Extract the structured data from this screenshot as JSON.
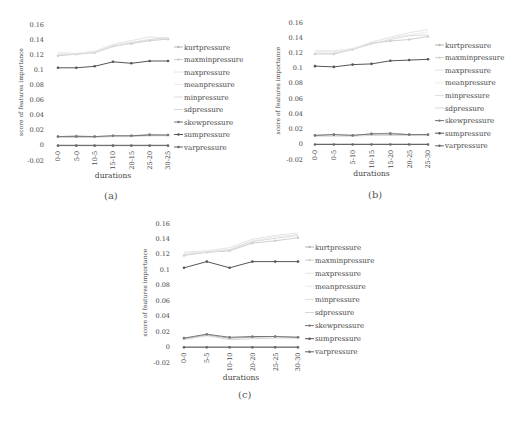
{
  "chart_data": [
    {
      "id": "a",
      "type": "line",
      "caption": "(a)",
      "title": "",
      "xlabel": "durations",
      "ylabel": "score of features importance",
      "ylim": [
        -0.02,
        0.16
      ],
      "yticks": [
        "0.16",
        "0.14",
        "0.12",
        "0.1",
        "0.08",
        "0.06",
        "0.04",
        "0.02",
        "0",
        "-0.02"
      ],
      "categories": [
        "0-0",
        "5-0",
        "10-5",
        "15-10",
        "20-15",
        "25-20",
        "30-25"
      ],
      "grid": false,
      "legend_position": "right",
      "series": [
        {
          "name": "kurtpressure",
          "color": "#b8b8b8",
          "marker": true,
          "values": [
            0.011,
            0.012,
            0.011,
            0.012,
            0.012,
            0.014,
            0.013
          ]
        },
        {
          "name": "maxminpressure",
          "color": "#cfcfcf",
          "marker": true,
          "values": [
            0.118,
            0.12,
            0.122,
            0.131,
            0.134,
            0.138,
            0.14
          ]
        },
        {
          "name": "maxpressure",
          "color": "#e4e4e4",
          "marker": false,
          "values": [
            0.122,
            0.121,
            0.124,
            0.133,
            0.138,
            0.143,
            0.141
          ]
        },
        {
          "name": "meanpressure",
          "color": "#ececec",
          "marker": false,
          "values": [
            0.12,
            0.121,
            0.123,
            0.132,
            0.136,
            0.14,
            0.141
          ]
        },
        {
          "name": "minpressure",
          "color": "#dcdcdc",
          "marker": false,
          "values": [
            0.119,
            0.12,
            0.122,
            0.13,
            0.135,
            0.139,
            0.142
          ]
        },
        {
          "name": "sdpressure",
          "color": "#d6d6d6",
          "marker": false,
          "values": [
            0.01,
            0.01,
            0.01,
            0.011,
            0.011,
            0.012,
            0.012
          ]
        },
        {
          "name": "skewpressure",
          "color": "#777777",
          "marker": true,
          "values": [
            0.011,
            0.011,
            0.011,
            0.012,
            0.012,
            0.013,
            0.013
          ]
        },
        {
          "name": "sumpressure",
          "color": "#555555",
          "marker": true,
          "values": [
            0.102,
            0.102,
            0.104,
            0.11,
            0.108,
            0.111,
            0.111
          ]
        },
        {
          "name": "varpressure",
          "color": "#666666",
          "marker": true,
          "values": [
            -0.001,
            -0.001,
            -0.001,
            -0.001,
            -0.001,
            -0.001,
            -0.001
          ]
        }
      ]
    },
    {
      "id": "b",
      "type": "line",
      "caption": "(b)",
      "title": "",
      "xlabel": "durations",
      "ylabel": "score of features importance",
      "ylim": [
        -0.02,
        0.16
      ],
      "yticks": [
        "0.16",
        "0.14",
        "0.12",
        "0.1",
        "0.08",
        "0.06",
        "0.04",
        "0.02",
        "0",
        "-0.02"
      ],
      "categories": [
        "0-0",
        "0-5",
        "5-10",
        "10-15",
        "15-20",
        "20-25",
        "25-30"
      ],
      "grid": false,
      "legend_position": "right",
      "series": [
        {
          "name": "kurtpressure",
          "color": "#b8b8b8",
          "marker": true,
          "values": [
            0.011,
            0.012,
            0.011,
            0.013,
            0.014,
            0.012,
            0.012
          ]
        },
        {
          "name": "maxminpressure",
          "color": "#cfcfcf",
          "marker": true,
          "values": [
            0.118,
            0.118,
            0.124,
            0.132,
            0.135,
            0.137,
            0.141
          ]
        },
        {
          "name": "maxpressure",
          "color": "#e4e4e4",
          "marker": false,
          "values": [
            0.122,
            0.122,
            0.125,
            0.133,
            0.14,
            0.146,
            0.15
          ]
        },
        {
          "name": "meanpressure",
          "color": "#ececec",
          "marker": false,
          "values": [
            0.121,
            0.121,
            0.125,
            0.134,
            0.139,
            0.143,
            0.147
          ]
        },
        {
          "name": "minpressure",
          "color": "#dcdcdc",
          "marker": false,
          "values": [
            0.119,
            0.119,
            0.124,
            0.131,
            0.137,
            0.142,
            0.143
          ]
        },
        {
          "name": "sdpressure",
          "color": "#d6d6d6",
          "marker": false,
          "values": [
            0.01,
            0.01,
            0.01,
            0.011,
            0.011,
            0.011,
            0.011
          ]
        },
        {
          "name": "skewpressure",
          "color": "#777777",
          "marker": true,
          "values": [
            0.011,
            0.012,
            0.011,
            0.013,
            0.013,
            0.012,
            0.012
          ]
        },
        {
          "name": "sumpressure",
          "color": "#555555",
          "marker": true,
          "values": [
            0.102,
            0.101,
            0.104,
            0.105,
            0.109,
            0.11,
            0.111
          ]
        },
        {
          "name": "varpressure",
          "color": "#666666",
          "marker": true,
          "values": [
            -0.001,
            -0.001,
            -0.001,
            -0.001,
            -0.001,
            -0.001,
            -0.001
          ]
        }
      ]
    },
    {
      "id": "c",
      "type": "line",
      "caption": "(c)",
      "title": "",
      "xlabel": "durations",
      "ylabel": "score of features importance",
      "ylim": [
        -0.02,
        0.16
      ],
      "yticks": [
        "0.16",
        "0.14",
        "0.12",
        "0.1",
        "0.08",
        "0.06",
        "0.04",
        "0.02",
        "0",
        "-0.02"
      ],
      "categories": [
        "0-0",
        "5-5",
        "10-10",
        "20-20",
        "25-25",
        "30-30"
      ],
      "grid": false,
      "legend_position": "right",
      "series": [
        {
          "name": "kurtpressure",
          "color": "#b8b8b8",
          "marker": true,
          "values": [
            0.01,
            0.015,
            0.011,
            0.012,
            0.013,
            0.012
          ]
        },
        {
          "name": "maxminpressure",
          "color": "#cfcfcf",
          "marker": true,
          "values": [
            0.118,
            0.122,
            0.124,
            0.134,
            0.137,
            0.141
          ]
        },
        {
          "name": "maxpressure",
          "color": "#e4e4e4",
          "marker": false,
          "values": [
            0.122,
            0.124,
            0.128,
            0.139,
            0.144,
            0.147
          ]
        },
        {
          "name": "meanpressure",
          "color": "#ececec",
          "marker": false,
          "values": [
            0.121,
            0.123,
            0.126,
            0.137,
            0.142,
            0.145
          ]
        },
        {
          "name": "minpressure",
          "color": "#dcdcdc",
          "marker": false,
          "values": [
            0.119,
            0.122,
            0.125,
            0.136,
            0.14,
            0.144
          ]
        },
        {
          "name": "sdpressure",
          "color": "#d6d6d6",
          "marker": false,
          "values": [
            0.009,
            0.014,
            0.009,
            0.01,
            0.011,
            0.011
          ]
        },
        {
          "name": "skewpressure",
          "color": "#777777",
          "marker": true,
          "values": [
            0.011,
            0.016,
            0.012,
            0.013,
            0.013,
            0.012
          ]
        },
        {
          "name": "sumpressure",
          "color": "#555555",
          "marker": true,
          "values": [
            0.102,
            0.11,
            0.102,
            0.11,
            0.11,
            0.11
          ]
        },
        {
          "name": "varpressure",
          "color": "#666666",
          "marker": true,
          "values": [
            -0.001,
            -0.001,
            -0.001,
            -0.001,
            -0.001,
            -0.001
          ]
        }
      ]
    }
  ],
  "panels": {
    "a": {
      "caption": "(a)"
    },
    "b": {
      "caption": "(b)"
    },
    "c": {
      "caption": "(c)"
    }
  }
}
